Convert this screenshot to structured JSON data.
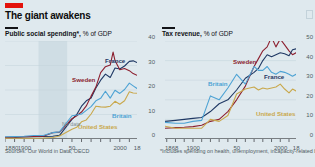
{
  "header": {
    "tag_color": "#e3120b",
    "title": "The giant awakens"
  },
  "panels": [
    {
      "id": "public-social-spending",
      "subtitle_bold": "Public social spending*,",
      "subtitle_light": " % of GDP",
      "source": "Sources: Our World in Data; OECD",
      "no_data_label": "No data"
    },
    {
      "id": "tax-revenue",
      "subtitle_bold": "Tax revenue,",
      "subtitle_light": " % of GDP",
      "footnote": "*Includes spending on health, unemployment, incapacity-related benefits"
    }
  ],
  "colors": {
    "france": "#1f3864",
    "sweden": "#8c1f2f",
    "britain": "#4ea3d4",
    "united_states": "#c9a84c",
    "background": "#dfe9ee",
    "grid": "#c3d2da",
    "axis": "#121317",
    "tick_text": "#4f5b63"
  },
  "chart_data": [
    {
      "type": "line",
      "title": "Public social spending*, % of GDP",
      "xlabel": "",
      "ylabel": "% of GDP",
      "xlim": [
        1880,
        2018
      ],
      "ylim": [
        0,
        40
      ],
      "yticks": [
        0,
        10,
        20,
        30,
        40
      ],
      "xticks": [
        1880,
        1900,
        1950,
        2000,
        2018
      ],
      "xtick_labels": [
        "1880",
        "1900",
        "50",
        "2000",
        "18"
      ],
      "grid": true,
      "legend": "inline-labels",
      "annotations": [
        {
          "text": "No data",
          "x": 1925,
          "y": 4
        }
      ],
      "series": [
        {
          "name": "France",
          "color": "#1f3864",
          "x": [
            1880,
            1890,
            1900,
            1910,
            1920,
            1930,
            1937,
            1950,
            1955,
            1960,
            1965,
            1970,
            1975,
            1980,
            1985,
            1990,
            1995,
            2000,
            2005,
            2010,
            2014,
            2018
          ],
          "values": [
            0.5,
            0.6,
            0.8,
            0.9,
            1.0,
            1.1,
            1.5,
            8.0,
            10.0,
            13.4,
            15.6,
            16.7,
            20.8,
            24.0,
            26.5,
            25.1,
            29.0,
            28.6,
            29.8,
            31.7,
            31.9,
            31.2
          ]
        },
        {
          "name": "Sweden",
          "color": "#8c1f2f",
          "x": [
            1880,
            1890,
            1900,
            1910,
            1920,
            1930,
            1937,
            1950,
            1955,
            1960,
            1965,
            1970,
            1975,
            1980,
            1985,
            1990,
            1993,
            1995,
            2000,
            2005,
            2010,
            2014,
            2018
          ],
          "values": [
            0.7,
            0.8,
            0.9,
            1.0,
            1.1,
            2.6,
            2.8,
            8.3,
            9.5,
            11.0,
            13.5,
            17.5,
            21.2,
            27.1,
            29.5,
            30.2,
            35.5,
            32.0,
            28.3,
            28.8,
            27.9,
            26.7,
            26.0
          ]
        },
        {
          "name": "Britain",
          "color": "#4ea3d4",
          "x": [
            1880,
            1890,
            1900,
            1910,
            1920,
            1930,
            1937,
            1950,
            1955,
            1960,
            1965,
            1970,
            1975,
            1980,
            1985,
            1990,
            1995,
            2000,
            2005,
            2010,
            2014,
            2018
          ],
          "values": [
            0.9,
            1.0,
            1.1,
            1.4,
            1.4,
            2.6,
            2.9,
            9.5,
            9.8,
            10.2,
            11.7,
            13.2,
            15.6,
            16.6,
            19.5,
            16.7,
            19.9,
            18.6,
            20.2,
            22.8,
            21.7,
            20.6
          ]
        },
        {
          "name": "United States",
          "color": "#c9a84c",
          "x": [
            1880,
            1890,
            1900,
            1910,
            1920,
            1930,
            1937,
            1950,
            1955,
            1960,
            1965,
            1970,
            1975,
            1980,
            1985,
            1990,
            1995,
            2000,
            2005,
            2010,
            2014,
            2018
          ],
          "values": [
            0.3,
            0.3,
            0.3,
            0.3,
            0.4,
            0.6,
            1.2,
            4.0,
            4.8,
            7.0,
            7.8,
            10.2,
            13.4,
            13.1,
            13.0,
            13.4,
            15.4,
            14.2,
            15.6,
            19.3,
            18.8,
            18.7
          ]
        }
      ]
    },
    {
      "type": "line",
      "title": "Tax revenue, % of GDP",
      "xlabel": "",
      "ylabel": "% of GDP",
      "xlim": [
        1868,
        2018
      ],
      "ylim": [
        0,
        50
      ],
      "yticks": [
        0,
        10,
        20,
        30,
        40,
        50
      ],
      "xticks": [
        1868,
        1900,
        1950,
        2000,
        2018
      ],
      "xtick_labels": [
        "1868",
        "1900",
        "50",
        "2000",
        "18"
      ],
      "grid": true,
      "legend": "inline-labels",
      "annotations": [],
      "series": [
        {
          "name": "Sweden",
          "color": "#8c1f2f",
          "x": [
            1868,
            1880,
            1890,
            1900,
            1910,
            1920,
            1930,
            1940,
            1950,
            1960,
            1970,
            1975,
            1980,
            1985,
            1990,
            1995,
            2000,
            2005,
            2010,
            2014,
            2018
          ],
          "values": [
            5.5,
            5.8,
            6.0,
            6.3,
            7.0,
            9.0,
            10.0,
            14.0,
            20.0,
            27.0,
            37.0,
            41.0,
            45.0,
            47.0,
            52.0,
            47.0,
            51.0,
            48.0,
            45.0,
            43.0,
            44.0
          ]
        },
        {
          "name": "France",
          "color": "#1f3864",
          "x": [
            1868,
            1880,
            1890,
            1900,
            1910,
            1920,
            1930,
            1940,
            1950,
            1960,
            1970,
            1975,
            1980,
            1985,
            1990,
            1995,
            2000,
            2005,
            2010,
            2014,
            2018
          ],
          "values": [
            9.0,
            9.5,
            10.0,
            10.5,
            11.0,
            14.0,
            18.0,
            20.0,
            25.0,
            31.0,
            34.0,
            36.0,
            40.0,
            43.0,
            42.0,
            43.0,
            44.0,
            43.5,
            42.5,
            45.5,
            46.0
          ]
        },
        {
          "name": "Britain",
          "color": "#4ea3d4",
          "x": [
            1868,
            1880,
            1890,
            1900,
            1910,
            1920,
            1930,
            1940,
            1950,
            1960,
            1970,
            1975,
            1980,
            1985,
            1990,
            1995,
            2000,
            2005,
            2010,
            2014,
            2018
          ],
          "values": [
            8.5,
            8.0,
            8.0,
            9.0,
            9.5,
            22.0,
            20.0,
            26.0,
            33.0,
            28.0,
            37.0,
            35.0,
            35.0,
            37.0,
            34.0,
            33.0,
            34.5,
            34.0,
            33.0,
            32.0,
            33.0
          ]
        },
        {
          "name": "United States",
          "color": "#c9a84c",
          "x": [
            1868,
            1880,
            1890,
            1900,
            1910,
            1920,
            1930,
            1940,
            1950,
            1960,
            1970,
            1975,
            1980,
            1985,
            1990,
            1995,
            2000,
            2005,
            2010,
            2014,
            2018
          ],
          "values": [
            6.5,
            5.5,
            5.5,
            5.5,
            5.5,
            10.0,
            9.0,
            12.0,
            23.0,
            25.5,
            26.5,
            25.0,
            26.0,
            25.5,
            26.0,
            26.5,
            28.0,
            25.5,
            23.5,
            25.5,
            24.5
          ]
        }
      ]
    }
  ],
  "series_labels": {
    "left": [
      {
        "name": "France",
        "color": "#1f3864",
        "x": 105,
        "y": 57
      },
      {
        "name": "Sweden",
        "color": "#8c1f2f",
        "x": 72,
        "y": 76
      },
      {
        "name": "Britain",
        "color": "#4ea3d4",
        "x": 112,
        "y": 112
      },
      {
        "name": "United States",
        "color": "#c9a84c",
        "x": 78,
        "y": 123
      }
    ],
    "right": [
      {
        "name": "Sweden",
        "color": "#8c1f2f",
        "x": 233,
        "y": 58
      },
      {
        "name": "France",
        "color": "#1f3864",
        "x": 264,
        "y": 73
      },
      {
        "name": "Britain",
        "color": "#4ea3d4",
        "x": 208,
        "y": 80
      },
      {
        "name": "United States",
        "color": "#c9a84c",
        "x": 256,
        "y": 110
      }
    ]
  }
}
